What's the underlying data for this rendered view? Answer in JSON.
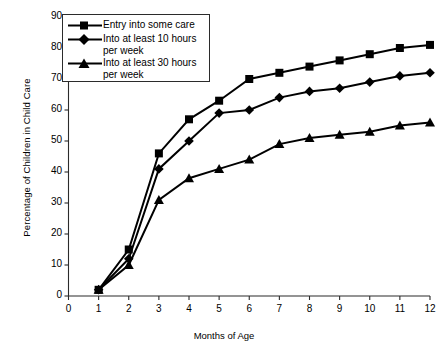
{
  "chart_data": {
    "type": "line",
    "title": "",
    "xlabel": "Months of Age",
    "ylabel": "Percentage of Children in Child Care",
    "x": [
      1,
      2,
      3,
      4,
      5,
      6,
      7,
      8,
      9,
      10,
      11,
      12
    ],
    "xticklabels": [
      "0",
      "1",
      "2",
      "3",
      "4",
      "5",
      "6",
      "7",
      "8",
      "9",
      "10",
      "11",
      "12"
    ],
    "xtickvalues": [
      0,
      1,
      2,
      3,
      4,
      5,
      6,
      7,
      8,
      9,
      10,
      11,
      12
    ],
    "yticklabels": [
      "0",
      "10",
      "20",
      "30",
      "40",
      "50",
      "60",
      "70",
      "80",
      "90"
    ],
    "ytickvalues": [
      0,
      10,
      20,
      30,
      40,
      50,
      60,
      70,
      80,
      90
    ],
    "xlim": [
      0,
      12
    ],
    "ylim": [
      0,
      90
    ],
    "grid": false,
    "legend_position": "upper left",
    "series": [
      {
        "name": "Entry into some care",
        "marker": "square",
        "values": [
          2,
          15,
          46,
          57,
          63,
          70,
          72,
          74,
          76,
          78,
          80,
          81
        ]
      },
      {
        "name": "Into at least 10 hours per week",
        "marker": "diamond",
        "values": [
          2,
          12,
          41,
          50,
          59,
          60,
          64,
          66,
          67,
          69,
          71,
          72
        ]
      },
      {
        "name": "Into at least 30 hours per week",
        "marker": "triangle",
        "values": [
          2,
          10,
          31,
          38,
          41,
          44,
          49,
          51,
          52,
          53,
          55,
          56
        ]
      }
    ],
    "colors": {
      "line": "#000000",
      "axis": "#2b2b2b",
      "background": "#ffffff"
    }
  }
}
